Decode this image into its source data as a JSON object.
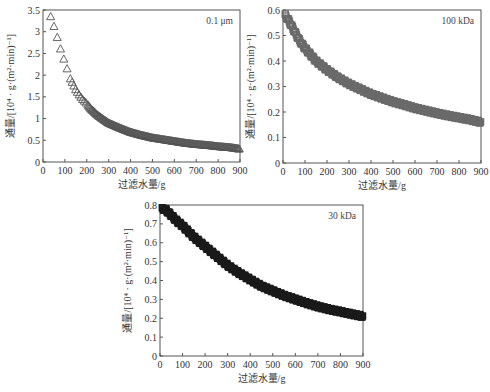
{
  "chart_data": [
    {
      "type": "scatter",
      "panel_label": "0.1 μm",
      "xlabel": "过滤水量/g",
      "ylabel": "通量/[10⁴ · g·(m²·min)⁻¹]",
      "xlim": [
        0,
        900
      ],
      "ylim": [
        0,
        3.5
      ],
      "xticks": [
        0,
        100,
        200,
        300,
        400,
        500,
        600,
        700,
        800,
        900
      ],
      "yticks": [
        0,
        0.5,
        1,
        1.5,
        2,
        2.5,
        3,
        3.5
      ],
      "ytick_labels": [
        "0",
        "0.5",
        "1",
        "1.5",
        "2",
        "2.5",
        "3",
        "3.5"
      ],
      "marker": "open-triangle",
      "marker_color": "#555555",
      "x": [
        35,
        55,
        70,
        85,
        100,
        110,
        120,
        135,
        150,
        165,
        180,
        200,
        220,
        250,
        280,
        300,
        350,
        400,
        450,
        500,
        550,
        600,
        650,
        700,
        750,
        800,
        850,
        880,
        900
      ],
      "y": [
        3.35,
        3.05,
        2.78,
        2.52,
        2.3,
        2.15,
        1.97,
        1.82,
        1.66,
        1.55,
        1.45,
        1.35,
        1.22,
        1.08,
        0.97,
        0.9,
        0.79,
        0.69,
        0.62,
        0.56,
        0.52,
        0.48,
        0.44,
        0.41,
        0.39,
        0.36,
        0.34,
        0.32,
        0.3
      ]
    },
    {
      "type": "scatter",
      "panel_label": "100 kDa",
      "xlabel": "过滤水量/g",
      "ylabel": "通量/[10⁴ · g·(m²·min)⁻¹]",
      "xlim": [
        0,
        900
      ],
      "ylim": [
        0,
        0.6
      ],
      "xticks": [
        0,
        100,
        200,
        300,
        400,
        500,
        600,
        700,
        800,
        900
      ],
      "yticks": [
        0,
        0.1,
        0.2,
        0.3,
        0.4,
        0.5,
        0.6
      ],
      "ytick_labels": [
        "0",
        "0.1",
        "0.2",
        "0.3",
        "0.4",
        "0.5",
        "0.6"
      ],
      "marker": "dense-open-square",
      "marker_color": "#6a6a6a",
      "x": [
        10,
        25,
        50,
        75,
        100,
        150,
        200,
        250,
        300,
        350,
        400,
        450,
        500,
        550,
        600,
        650,
        700,
        750,
        800,
        850,
        900
      ],
      "y": [
        0.58,
        0.56,
        0.52,
        0.48,
        0.45,
        0.4,
        0.365,
        0.335,
        0.31,
        0.29,
        0.27,
        0.255,
        0.24,
        0.228,
        0.215,
        0.205,
        0.195,
        0.186,
        0.178,
        0.17,
        0.16
      ]
    },
    {
      "type": "scatter",
      "panel_label": "30 kDa",
      "xlabel": "过滤水量/g",
      "ylabel": "通量/[10⁴ · g·(m²·min)⁻¹]",
      "xlim": [
        0,
        900
      ],
      "ylim": [
        0,
        0.8
      ],
      "xticks": [
        0,
        100,
        200,
        300,
        400,
        500,
        600,
        700,
        800,
        900
      ],
      "yticks": [
        0,
        0.1,
        0.2,
        0.3,
        0.4,
        0.5,
        0.6,
        0.7,
        0.8
      ],
      "ytick_labels": [
        "0",
        "0.1",
        "0.2",
        "0.3",
        "0.4",
        "0.5",
        "0.6",
        "0.7",
        "0.8"
      ],
      "marker": "dense-open-square",
      "marker_color": "#1a1a1a",
      "x": [
        10,
        25,
        50,
        75,
        100,
        150,
        200,
        250,
        300,
        350,
        400,
        450,
        500,
        550,
        600,
        650,
        700,
        750,
        800,
        850,
        900
      ],
      "y": [
        0.78,
        0.775,
        0.745,
        0.715,
        0.69,
        0.63,
        0.58,
        0.53,
        0.48,
        0.44,
        0.405,
        0.37,
        0.345,
        0.32,
        0.3,
        0.28,
        0.262,
        0.247,
        0.235,
        0.222,
        0.21
      ]
    }
  ],
  "layout": {
    "panels": [
      {
        "left": 43,
        "top": 10,
        "right": 240,
        "bottom": 162
      },
      {
        "left": 283,
        "top": 10,
        "right": 481,
        "bottom": 163
      },
      {
        "left": 160,
        "top": 205,
        "right": 363,
        "bottom": 356
      }
    ]
  }
}
